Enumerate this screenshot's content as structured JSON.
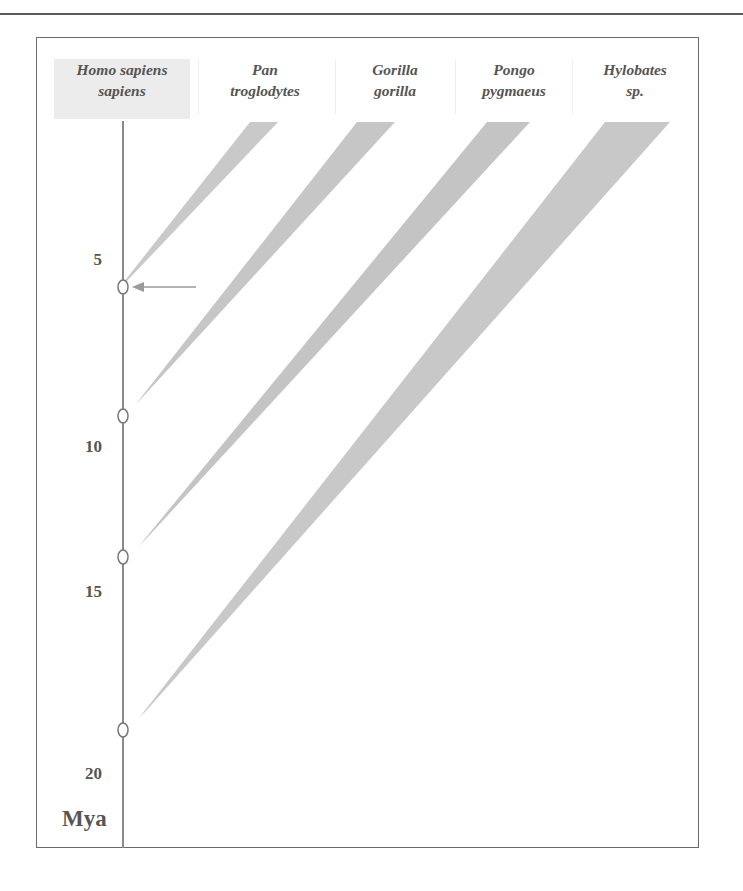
{
  "columns": [
    {
      "line1": "Homo sapiens",
      "line2": "sapiens",
      "highlighted": true
    },
    {
      "line1": "Pan",
      "line2": "troglodytes",
      "highlighted": false
    },
    {
      "line1": "Gorilla",
      "line2": "gorilla",
      "highlighted": false
    },
    {
      "line1": "Pongo",
      "line2": "pygmaeus",
      "highlighted": false
    },
    {
      "line1": "Hylobates",
      "line2": "sp.",
      "highlighted": false
    }
  ],
  "axis": {
    "unit": "Mya",
    "ticks": [
      "5",
      "10",
      "15",
      "20"
    ]
  },
  "divergence_points_mya": [
    5.8,
    9.3,
    13.5,
    18.5
  ],
  "arrow": {
    "points_to": "Homo–Pan divergence",
    "icon": "arrow-left-icon"
  },
  "colors": {
    "text": "#555555",
    "wedge": "#c8c8c8",
    "axis": "#8a8a8a",
    "header_highlight": "#ececec"
  }
}
